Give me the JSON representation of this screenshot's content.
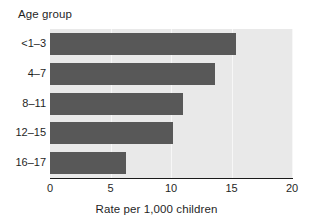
{
  "chart_data": {
    "type": "bar",
    "orientation": "horizontal",
    "title": "Age group",
    "categories": [
      "<1–3",
      "4–7",
      "8–11",
      "12–15",
      "16–17"
    ],
    "values": [
      15.4,
      13.6,
      11.0,
      10.2,
      6.3
    ],
    "xlabel": "Rate per 1,000 children",
    "ylabel": "Age group",
    "xlim": [
      0,
      20
    ],
    "xticks": [
      0,
      5,
      10,
      15,
      20
    ],
    "xtick_labels": [
      "0",
      "5",
      "10",
      "15",
      "20"
    ],
    "grid": true,
    "legend": false,
    "bar_color": "#585858",
    "plot_background": "#e9e9e9",
    "gridline_color": "#f7f7f7",
    "axis_color": "#1a1a1a"
  }
}
